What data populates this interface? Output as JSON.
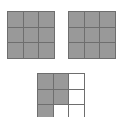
{
  "figure": {
    "background_color": "#ffffff",
    "shaded_color": "#999999",
    "unshaded_color": "#ffffff",
    "line_color": "#6e6e6e",
    "rows": 3,
    "columns": 3,
    "grid_count": 3
  },
  "grids": [
    {
      "name": "grid-1",
      "position": "top-left",
      "rows": 3,
      "columns": 3,
      "shaded_count": 9,
      "total_count": 9,
      "cells": [
        [
          true,
          true,
          true
        ],
        [
          true,
          true,
          true
        ],
        [
          true,
          true,
          true
        ]
      ]
    },
    {
      "name": "grid-2",
      "position": "top-right",
      "rows": 3,
      "columns": 3,
      "shaded_count": 9,
      "total_count": 9,
      "cells": [
        [
          true,
          true,
          true
        ],
        [
          true,
          true,
          true
        ],
        [
          true,
          true,
          true
        ]
      ]
    },
    {
      "name": "grid-3",
      "position": "bottom-center",
      "rows": 3,
      "columns": 3,
      "shaded_count": 5,
      "total_count": 9,
      "cells": [
        [
          true,
          true,
          false
        ],
        [
          true,
          true,
          false
        ],
        [
          true,
          false,
          false
        ]
      ]
    }
  ],
  "chart_data": {
    "type": "heatmap",
    "xlabel": "",
    "ylabel": "",
    "categories": [
      "column 1",
      "column 2",
      "column 3"
    ],
    "row_labels": [
      "row 1",
      "row 2",
      "row 3"
    ],
    "grid": true,
    "legend": "none",
    "value_map": {
      "1": "shaded",
      "0": "unshaded"
    },
    "series": [
      {
        "name": "grid-1",
        "values": [
          [
            1,
            1,
            1
          ],
          [
            1,
            1,
            1
          ],
          [
            1,
            1,
            1
          ]
        ],
        "shaded_total": 9
      },
      {
        "name": "grid-2",
        "values": [
          [
            1,
            1,
            1
          ],
          [
            1,
            1,
            1
          ],
          [
            1,
            1,
            1
          ]
        ],
        "shaded_total": 9
      },
      {
        "name": "grid-3",
        "values": [
          [
            1,
            1,
            0
          ],
          [
            1,
            1,
            0
          ],
          [
            1,
            0,
            0
          ]
        ],
        "shaded_total": 5
      }
    ]
  }
}
